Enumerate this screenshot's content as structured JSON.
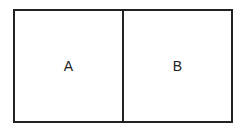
{
  "diagram": {
    "cells": [
      {
        "label": "A"
      },
      {
        "label": "B"
      }
    ],
    "colors": {
      "stroke": "#222222",
      "background": "#ffffff"
    }
  }
}
